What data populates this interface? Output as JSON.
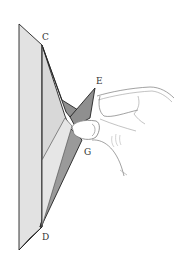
{
  "diagram": {
    "type": "origami-fold-instruction",
    "labels": {
      "c": "C",
      "e": "E",
      "g": "G",
      "d": "D"
    },
    "colors": {
      "paper_light": "#e2e2e2",
      "paper_mid": "#d4d4d4",
      "paper_dark": "#8f8f8f",
      "outline": "#222222",
      "hand_line": "#7a7a7a",
      "background": "#ffffff"
    }
  }
}
